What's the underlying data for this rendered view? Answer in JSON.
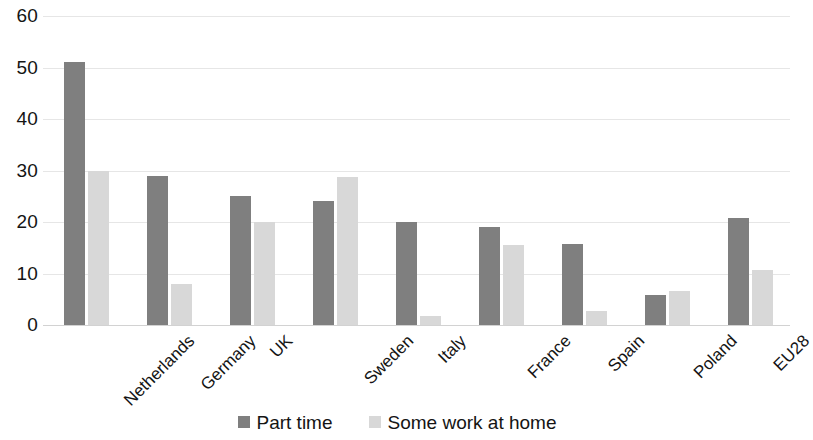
{
  "chart_data": {
    "type": "bar",
    "title": "",
    "subtitle": "",
    "xlabel": "",
    "ylabel": "",
    "categories": [
      "Netherlands",
      "Germany",
      "UK",
      "Sweden",
      "Italy",
      "France",
      "Spain",
      "Poland",
      "EU28"
    ],
    "series": [
      {
        "name": "Part time",
        "color": "#7f7f7f",
        "values": [
          51,
          29,
          25,
          24,
          20,
          19,
          15.8,
          5.8,
          20.8
        ]
      },
      {
        "name": "Some work at home",
        "color": "#d8d8d8",
        "values": [
          30,
          8,
          20,
          28.7,
          1.8,
          15.6,
          2.8,
          6.7,
          10.6
        ]
      }
    ],
    "ylim": [
      0,
      60
    ],
    "yticks": [
      "0",
      "10",
      "20",
      "30",
      "40",
      "50",
      "60"
    ],
    "ytick_values": [
      0,
      10,
      20,
      30,
      40,
      50,
      60
    ],
    "grid": true,
    "legend_position": "bottom",
    "gridline_color": "#e6e6e6",
    "background_color": "#ffffff",
    "axis_text_color": "#141414"
  },
  "legend": {
    "items": [
      {
        "label": "Part time",
        "color": "#7f7f7f"
      },
      {
        "label": "Some work at home",
        "color": "#d8d8d8"
      }
    ]
  }
}
